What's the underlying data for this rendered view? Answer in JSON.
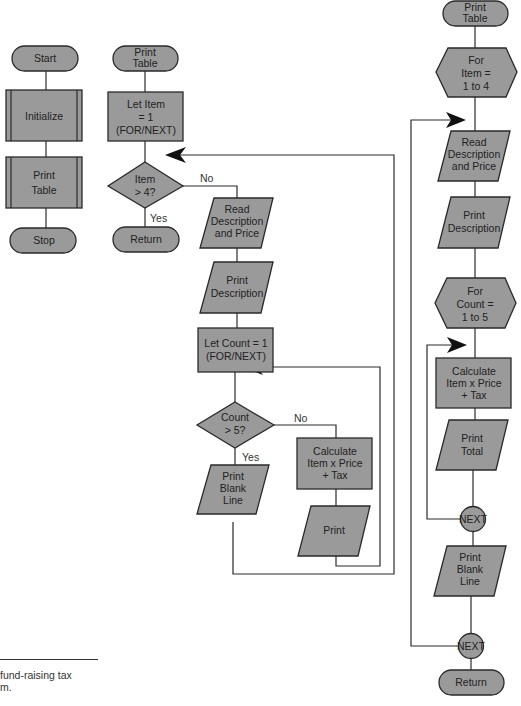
{
  "diagram": {
    "main": {
      "start": "Start",
      "initialize": "Initialize",
      "print_table": [
        "Print",
        "Table"
      ],
      "stop": "Stop"
    },
    "print_table_if": {
      "title": [
        "Print",
        "Table"
      ],
      "let_item": [
        "Let Item",
        "= 1",
        "(FOR/NEXT)"
      ],
      "item_gt4": [
        "Item",
        "> 4?"
      ],
      "no_label": "No",
      "yes_label": "Yes",
      "return": "Return",
      "read_desc": [
        "Read",
        "Description",
        "and Price"
      ],
      "print_desc": [
        "Print",
        "Description"
      ],
      "let_count": [
        "Let Count = 1",
        "(FOR/NEXT)"
      ],
      "count_gt5": [
        "Count",
        "> 5?"
      ],
      "no_label2": "No",
      "yes_label2": "Yes",
      "print_blank": [
        "Print",
        "Blank",
        "Line"
      ],
      "calculate": [
        "Calculate",
        "Item x Price",
        "+ Tax"
      ],
      "print": "Print"
    },
    "print_table_for": {
      "title": [
        "Print",
        "Table"
      ],
      "for_item": [
        "For",
        "Item =",
        "1 to 4"
      ],
      "read_desc": [
        "Read",
        "Description",
        "and Price"
      ],
      "print_desc": [
        "Print",
        "Description"
      ],
      "for_count": [
        "For",
        "Count =",
        "1 to 5"
      ],
      "calculate": [
        "Calculate",
        "Item x Price",
        "+ Tax"
      ],
      "print_total": [
        "Print",
        "Total"
      ],
      "next1": "NEXT",
      "print_blank": [
        "Print",
        "Blank",
        "Line"
      ],
      "next2": "NEXT",
      "return": "Return"
    }
  },
  "caption": {
    "line1": "fund-raising tax",
    "line2": "m."
  },
  "colors": {
    "shape_fill": "#9a9a9a",
    "stroke": "#2a2a2a",
    "background": "#ffffff"
  }
}
